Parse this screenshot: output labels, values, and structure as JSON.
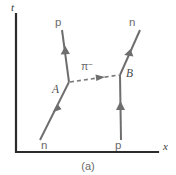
{
  "figure": {
    "caption": "(a)",
    "type": "feynman-diagram"
  },
  "axes": {
    "y_label": "t",
    "x_label": "x",
    "origin": {
      "x": 16,
      "y": 152
    },
    "y_top": {
      "x": 16,
      "y": 14
    },
    "x_right": {
      "x": 158,
      "y": 152
    }
  },
  "vertices": [
    {
      "name": "A",
      "label": "A",
      "x": 69,
      "y": 82,
      "label_x": 55,
      "label_y": 90
    },
    {
      "name": "B",
      "label": "B",
      "x": 120,
      "y": 75,
      "label_x": 127,
      "label_y": 74
    }
  ],
  "particles": [
    {
      "id": "incoming-neutron",
      "label": "n",
      "role": "incoming",
      "line_style": "solid",
      "label_x": 45,
      "label_y": 146,
      "from": {
        "x": 40,
        "y": 140
      },
      "to": {
        "x": 69,
        "y": 82
      },
      "arrow_direction": "up-right"
    },
    {
      "id": "outgoing-proton",
      "label": "p",
      "role": "outgoing",
      "line_style": "solid",
      "label_x": 58,
      "label_y": 24,
      "from": {
        "x": 69,
        "y": 82
      },
      "to": {
        "x": 62,
        "y": 30
      },
      "arrow_direction": "up"
    },
    {
      "id": "incoming-proton",
      "label": "p",
      "role": "incoming",
      "line_style": "solid",
      "label_x": 118,
      "label_y": 146,
      "from": {
        "x": 121,
        "y": 140
      },
      "to": {
        "x": 120,
        "y": 75
      },
      "arrow_direction": "up"
    },
    {
      "id": "outgoing-neutron",
      "label": "n",
      "role": "outgoing",
      "line_style": "solid",
      "label_x": 131,
      "label_y": 24,
      "from": {
        "x": 120,
        "y": 75
      },
      "to": {
        "x": 140,
        "y": 30
      },
      "arrow_direction": "up-right"
    },
    {
      "id": "exchanged-pion",
      "label": "π",
      "superscript": "−",
      "role": "exchange",
      "line_style": "dashed",
      "label_x": 88,
      "label_y": 68,
      "from": {
        "x": 69,
        "y": 82
      },
      "to": {
        "x": 120,
        "y": 75
      },
      "arrow_direction": "right"
    }
  ],
  "colors": {
    "axis": "#2b2b2b",
    "particle_line": "#6e6e6e",
    "boson_line": "#7a7a7a",
    "label_text": "#6a6a6a",
    "vertex_text": "#4a4a4a",
    "background": "#ffffff"
  }
}
